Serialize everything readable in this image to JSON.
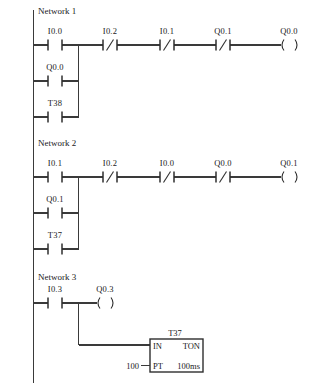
{
  "document": {
    "type": "ladder-logic-diagram",
    "networks": [
      {
        "title": "Network 1",
        "rungs": [
          {
            "branch_label": "main",
            "elements": [
              {
                "kind": "contact-no",
                "label": "I0.0"
              },
              {
                "kind": "contact-nc",
                "label": "I0.2"
              },
              {
                "kind": "contact-nc",
                "label": "I0.1"
              },
              {
                "kind": "contact-nc",
                "label": "Q0.1"
              },
              {
                "kind": "coil",
                "label": "Q0.0"
              }
            ]
          },
          {
            "branch_label": "parallel-1",
            "elements": [
              {
                "kind": "contact-no",
                "label": "Q0.0"
              }
            ]
          },
          {
            "branch_label": "parallel-2",
            "elements": [
              {
                "kind": "contact-no",
                "label": "T38"
              }
            ]
          }
        ]
      },
      {
        "title": "Network 2",
        "rungs": [
          {
            "branch_label": "main",
            "elements": [
              {
                "kind": "contact-no",
                "label": "I0.1"
              },
              {
                "kind": "contact-nc",
                "label": "I0.2"
              },
              {
                "kind": "contact-nc",
                "label": "I0.0"
              },
              {
                "kind": "contact-nc",
                "label": "Q0.0"
              },
              {
                "kind": "coil",
                "label": "Q0.1"
              }
            ]
          },
          {
            "branch_label": "parallel-1",
            "elements": [
              {
                "kind": "contact-no",
                "label": "Q0.1"
              }
            ]
          },
          {
            "branch_label": "parallel-2",
            "elements": [
              {
                "kind": "contact-no",
                "label": "T37"
              }
            ]
          }
        ]
      },
      {
        "title": "Network 3",
        "rungs": [
          {
            "branch_label": "main",
            "elements": [
              {
                "kind": "contact-no",
                "label": "I0.3"
              },
              {
                "kind": "coil",
                "label": "Q0.3"
              }
            ]
          }
        ],
        "timer_block": {
          "name": "T37",
          "input_label": "IN",
          "type_label": "TON",
          "preset_label": "PT",
          "preset_value": "100",
          "time_base": "100ms"
        }
      }
    ]
  },
  "colors": {
    "wire": "#3a3a3a",
    "text": "#1a1a1a",
    "background": "#ffffff"
  }
}
